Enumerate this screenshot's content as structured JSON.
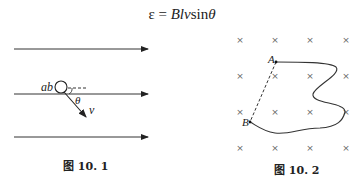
{
  "formula": {
    "lhs": "ε",
    "eq": " = ",
    "rhs_italic_1": "Blv",
    "rhs_roman": "sin",
    "rhs_italic_2": "θ"
  },
  "figure1": {
    "caption": "图 10. 1",
    "labels": {
      "conductor": "ab",
      "angle": "θ",
      "velocity": "v"
    },
    "field_lines": 3
  },
  "figure2": {
    "caption": "图 10. 2",
    "labels": {
      "point_a": "A",
      "point_b": "B"
    },
    "cross_symbol": "×",
    "grid_rows": 4,
    "grid_cols": 4
  }
}
